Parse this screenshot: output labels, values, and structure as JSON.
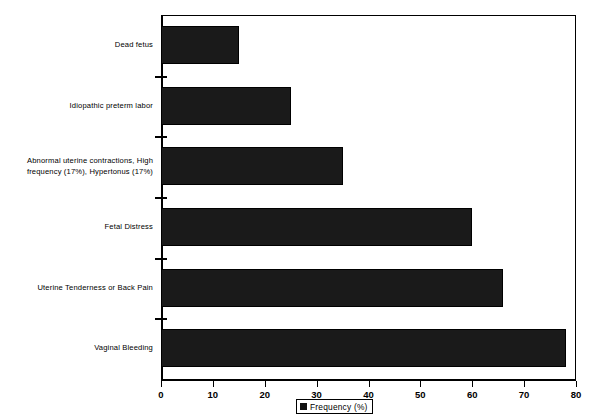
{
  "chart_data": {
    "type": "bar",
    "orientation": "horizontal",
    "title": "",
    "xlabel": "",
    "ylabel": "",
    "xlim": [
      0,
      80
    ],
    "xticks": [
      0,
      10,
      20,
      30,
      40,
      50,
      60,
      70,
      80
    ],
    "xtick_labels": [
      "0",
      "10",
      "20",
      "30",
      "40",
      "50",
      "60",
      "70",
      "80"
    ],
    "grid": false,
    "legend": {
      "position": "bottom-center",
      "entries": [
        {
          "label": "Frequency  (%)",
          "color": "#111111",
          "marker": "square"
        }
      ]
    },
    "bar_color": "#1a1a1a",
    "categories": [
      "Dead fetus",
      "Idiopathic preterm labor",
      "Abnormal uterine contractions, High frequency (17%), Hypertonus (17%)",
      "Fetal Distress",
      "Uterine Tenderness or Back Pain",
      "Vaginal Bleeding"
    ],
    "category_lines": [
      [
        "Dead fetus"
      ],
      [
        "Idiopathic preterm labor"
      ],
      [
        "Abnormal uterine contractions, High",
        "frequency (17%), Hypertonus (17%)"
      ],
      [
        "Fetal Distress"
      ],
      [
        "Uterine Tenderness or Back Pain"
      ],
      [
        "Vaginal Bleeding"
      ]
    ],
    "values": [
      15,
      25,
      35,
      60,
      66,
      78
    ],
    "series": [
      {
        "name": "Frequency  (%)",
        "values": [
          15,
          25,
          35,
          60,
          66,
          78
        ]
      }
    ]
  }
}
